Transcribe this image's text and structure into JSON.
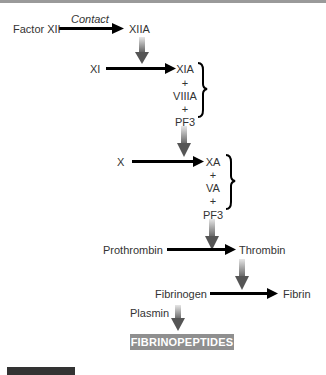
{
  "diagram": {
    "title_border": true,
    "nodes": {
      "factor_xii": "Factor XII",
      "contact": "Contact",
      "xiia": "XIIA",
      "xi": "XI",
      "xia": "XIA",
      "plus1": "+",
      "viiia": "VIIIA",
      "plus2": "+",
      "pf3_1": "PF3",
      "x": "X",
      "xa": "XA",
      "plus3": "+",
      "va": "VA",
      "plus4": "+",
      "pf3_2": "PF3",
      "prothrombin": "Prothrombin",
      "thrombin": "Thrombin",
      "fibrinogen": "Fibrinogen",
      "fibrin": "Fibrin",
      "plasmin": "Plasmin",
      "fibrinopeptides": "FIBRINOPEPTIDES"
    },
    "edges": [
      {
        "from": "Factor XII",
        "to": "XIIA",
        "label": "Contact",
        "type": "conversion"
      },
      {
        "from": "XIIA",
        "to": "XI→XIA",
        "type": "catalysis"
      },
      {
        "from": "XI",
        "to": "XIA",
        "type": "conversion"
      },
      {
        "from": "XIA+VIIIA+PF3",
        "to": "X→XA",
        "type": "catalysis"
      },
      {
        "from": "X",
        "to": "XA",
        "type": "conversion"
      },
      {
        "from": "XA+VA+PF3",
        "to": "Prothrombin→Thrombin",
        "type": "catalysis"
      },
      {
        "from": "Prothrombin",
        "to": "Thrombin",
        "type": "conversion"
      },
      {
        "from": "Thrombin",
        "to": "Fibrinogen→Fibrin",
        "type": "catalysis"
      },
      {
        "from": "Fibrinogen",
        "to": "Fibrin",
        "type": "conversion"
      },
      {
        "from": "Plasmin",
        "to": "FIBRINOPEPTIDES",
        "type": "catalysis"
      }
    ],
    "colors": {
      "arrow": "#000000",
      "catalysis_arrow": "#6e6e6e",
      "badge_bg": "#8f8f8f",
      "badge_text": "#ffffff"
    }
  }
}
